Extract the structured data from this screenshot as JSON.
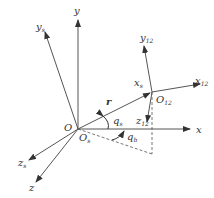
{
  "figure": {
    "type": "coordinate-frame-diagram",
    "colors": {
      "axis": "#555555",
      "dashed": "#555555",
      "text": "#333333",
      "background": "#ffffff"
    },
    "labels": {
      "y": "y",
      "y_s": "y",
      "y_s_sub": "s",
      "x": "x",
      "z_s": "z",
      "z_s_sub": "s",
      "z": "z",
      "O": "O",
      "O_s": "O",
      "O_s_sub": "s",
      "r": "r",
      "q_s": "q",
      "q_s_sub": "s",
      "q_b": "q",
      "q_b_sub": "b",
      "O_12": "O",
      "O_12_sub": "12",
      "x_s": "x",
      "x_s_sub": "s",
      "x_12": "x",
      "x_12_sub": "12",
      "y_12": "y",
      "y_12_sub": "12",
      "z_12": "z",
      "z_12_sub": "12"
    }
  }
}
